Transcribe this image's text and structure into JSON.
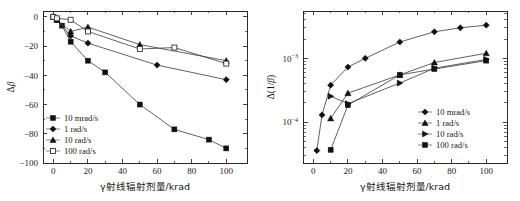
{
  "figure": {
    "title": "",
    "panels": [
      "left",
      "right"
    ]
  },
  "chart_data": [
    {
      "id": "left",
      "type": "line",
      "title": "",
      "xlabel": "γ射线辐射剂量/krad",
      "ylabel": "Δβ",
      "ylabel_delta": "Δ",
      "ylabel_beta": "β",
      "xlim": [
        -6,
        112
      ],
      "ylim": [
        -100,
        4
      ],
      "xticks": [
        0,
        20,
        40,
        60,
        80,
        100
      ],
      "xticklabels": [
        "0",
        "20",
        "40",
        "60",
        "80",
        "100"
      ],
      "yticks": [
        0,
        -20,
        -40,
        -60,
        -80,
        -100
      ],
      "yticklabels": [
        "0",
        "−20",
        "−40",
        "−60",
        "−80",
        "−100"
      ],
      "yscale": "linear",
      "grid": false,
      "legend_position": "lower-left",
      "series": [
        {
          "name": "10 mrad/s",
          "marker": "square-filled",
          "x": [
            0,
            2,
            5,
            10,
            20,
            30,
            50,
            70,
            90,
            100
          ],
          "y": [
            0,
            -2,
            -6,
            -17,
            -30,
            -38,
            -60,
            -77,
            -84,
            -90
          ]
        },
        {
          "name": "1 rad/s",
          "marker": "diamond-filled",
          "x": [
            0,
            2,
            10,
            20,
            60,
            100
          ],
          "y": [
            0,
            -2,
            -13,
            -18,
            -33,
            -43
          ]
        },
        {
          "name": "10 rad/s",
          "marker": "triangle-filled",
          "x": [
            0,
            2,
            10,
            20,
            50,
            100
          ],
          "y": [
            0,
            -2,
            -10,
            -7,
            -19,
            -30
          ]
        },
        {
          "name": "100 rad/s",
          "marker": "square-open",
          "x": [
            0,
            2,
            10,
            20,
            50,
            70,
            100
          ],
          "y": [
            0,
            -1,
            -2,
            -10,
            -22,
            -21,
            -32
          ]
        }
      ]
    },
    {
      "id": "right",
      "type": "line",
      "title": "",
      "xlabel": "γ射线辐射剂量/krad",
      "ylabel": "Δ(1/β)",
      "ylabel_delta": "Δ(1/",
      "ylabel_beta": "β",
      "ylabel_close": ")",
      "xlim": [
        -6,
        112
      ],
      "ylim": [
        2.3e-05,
        0.0055
      ],
      "xticks": [
        0,
        20,
        40,
        60,
        80,
        100
      ],
      "xticklabels": [
        "0",
        "20",
        "40",
        "60",
        "80",
        "100"
      ],
      "yticks": [
        0.001,
        0.0001
      ],
      "yticklabels": [
        "10⁻³",
        "10⁻⁴"
      ],
      "ytick_mantissa": [
        "10",
        "10"
      ],
      "ytick_exponent": [
        "−3",
        "−4"
      ],
      "yscale": "log",
      "grid": false,
      "legend_position": "lower-right",
      "series": [
        {
          "name": "10 mrad/s",
          "marker": "diamond-filled",
          "x": [
            2,
            5,
            10,
            20,
            30,
            50,
            70,
            85,
            100
          ],
          "y": [
            3.6e-05,
            0.00013,
            0.00038,
            0.00073,
            0.001,
            0.0018,
            0.0026,
            0.003,
            0.0033
          ]
        },
        {
          "name": "1 rad/s",
          "marker": "triangle-filled",
          "x": [
            10,
            20,
            50,
            70,
            100
          ],
          "y": [
            0.000115,
            0.000285,
            0.00055,
            0.00086,
            0.0012
          ]
        },
        {
          "name": "10 rad/s",
          "marker": "triangle-right-filled",
          "x": [
            10,
            20,
            50,
            70,
            100
          ],
          "y": [
            0.000255,
            0.000195,
            0.00041,
            0.0007,
            0.00096
          ]
        },
        {
          "name": "100 rad/s",
          "marker": "square-filled",
          "x": [
            10,
            20,
            50,
            70,
            100
          ],
          "y": [
            3.7e-05,
            0.000185,
            0.00055,
            0.00068,
            0.00092
          ]
        }
      ]
    }
  ]
}
